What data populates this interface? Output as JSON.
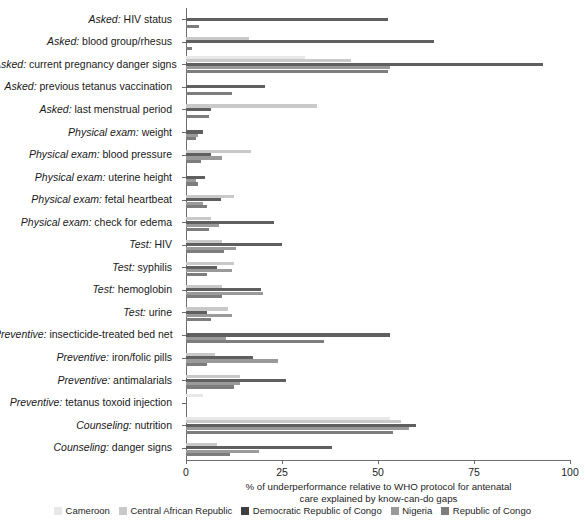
{
  "chart_data": {
    "type": "bar",
    "orientation": "horizontal",
    "grouped": true,
    "title": "",
    "xlabel": "% of underperformance relative to WHO protocol for antenatal care explained by know-can-do gaps",
    "xlabel_lines": [
      "% of underperformance relative to WHO protocol for antenatal",
      "care explained by know-can-do gaps"
    ],
    "ylabel": "",
    "xlim": [
      0,
      100
    ],
    "xticks": [
      0,
      25,
      50,
      75,
      100
    ],
    "xtick_labels": [
      "0",
      "25",
      "50",
      "75",
      "100"
    ],
    "grid": false,
    "legend_position": "bottom",
    "categories": [
      "Asked: HIV status",
      "Asked: blood group/rhesus",
      "Asked: current pregnancy danger signs",
      "Asked: previous tetanus vaccination",
      "Asked: last menstrual period",
      "Physical exam: weight",
      "Physical exam: blood pressure",
      "Physical exam: uterine height",
      "Physical exam: fetal heartbeat",
      "Physical exam: check for edema",
      "Test: HIV",
      "Test: syphilis",
      "Test: hemoglobin",
      "Test: urine",
      "Preventive: insecticide-treated bed net",
      "Preventive: iron/folic pills",
      "Preventive: antimalarials",
      "Preventive: tetanus toxoid injection",
      "Counseling: nutrition",
      "Counseling: danger signs"
    ],
    "category_prefix_italic": [
      "Asked:",
      "Asked:",
      "Asked:",
      "Asked:",
      "Asked:",
      "Physical exam:",
      "Physical exam:",
      "Physical exam:",
      "Physical exam:",
      "Physical exam:",
      "Test:",
      "Test:",
      "Test:",
      "Test:",
      "Preventive:",
      "Preventive:",
      "Preventive:",
      "Preventive:",
      "Counseling:",
      "Counseling:"
    ],
    "series": [
      {
        "name": "Cameroon",
        "color": "#e8e8e8",
        "values": [
          0,
          0,
          31,
          0,
          0,
          0,
          0,
          0,
          0,
          0,
          0,
          0,
          0,
          0,
          0,
          0,
          0,
          4.5,
          53,
          0
        ]
      },
      {
        "name": "Central African Republic",
        "color": "#c9c9c9",
        "values": [
          0,
          16.5,
          43,
          0,
          34,
          0,
          17,
          0,
          12.5,
          6.5,
          9.5,
          12.5,
          9.5,
          11,
          0,
          7.5,
          14,
          0,
          56,
          8
        ]
      },
      {
        "name": "Democratic Republic of Congo",
        "color": "#5f5f5f",
        "values": [
          52.5,
          64.5,
          93,
          20.5,
          6.5,
          4.5,
          6.5,
          5,
          9,
          23,
          25,
          8,
          19.5,
          5.5,
          53,
          17.5,
          26,
          0,
          60,
          38
        ]
      },
      {
        "name": "Nigeria",
        "color": "#9a9a9a",
        "values": [
          0,
          0,
          53,
          0,
          0,
          3,
          9.5,
          2.5,
          4.5,
          8.5,
          13,
          12,
          20,
          12,
          10.5,
          24,
          14,
          0,
          58,
          19
        ]
      },
      {
        "name": "Republic of Congo",
        "color": "#7d7d7d",
        "values": [
          3.5,
          1.5,
          52.5,
          12,
          6,
          2.5,
          4,
          3,
          5.5,
          6,
          10,
          5.5,
          9.5,
          6.5,
          36,
          5.5,
          12.5,
          0,
          54,
          11.5
        ]
      }
    ]
  },
  "legend": {
    "items": [
      {
        "label": "Cameroon",
        "color": "#e8e8e8"
      },
      {
        "label": "Central African Republic",
        "color": "#c9c9c9"
      },
      {
        "label": "Democratic Republic of Congo",
        "color": "#3f3f3f"
      },
      {
        "label": "Nigeria",
        "color": "#9a9a9a"
      },
      {
        "label": "Republic of Congo",
        "color": "#7d7d7d"
      }
    ]
  },
  "axis": {
    "x_title_line1": "% of underperformance relative to WHO protocol for antenatal",
    "x_title_line2": "care explained by know-can-do gaps"
  }
}
